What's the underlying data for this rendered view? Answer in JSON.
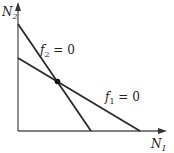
{
  "diagram": {
    "type": "phase-plane-nullclines",
    "axes": {
      "x": {
        "label": "N",
        "subscript": "1"
      },
      "y": {
        "label": "N",
        "subscript": "2"
      }
    },
    "lines": [
      {
        "name": "f2",
        "label_func": "f",
        "label_sub": "2",
        "label_rest": " = 0"
      },
      {
        "name": "f1",
        "label_func": "f",
        "label_sub": "1",
        "label_rest": " = 0"
      }
    ],
    "equilibrium_point": {
      "shown": true
    },
    "colors": {
      "line": "#2a2a2a",
      "background": "#ffffff"
    }
  }
}
